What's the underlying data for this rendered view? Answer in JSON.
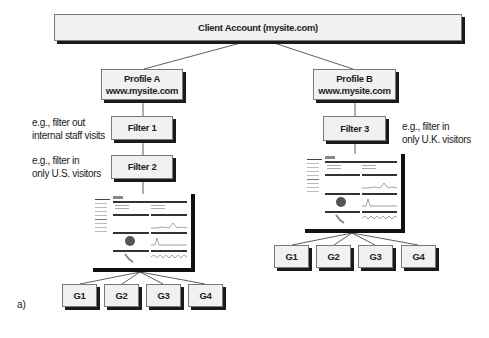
{
  "diagram": {
    "root": {
      "label": "Client Account (mysite.com)"
    },
    "profiles": [
      {
        "title": "Profile A",
        "site": "www.mysite.com",
        "filters": [
          {
            "label": "Filter 1",
            "note_line1": "e.g., filter out",
            "note_line2": "internal staff visits"
          },
          {
            "label": "Filter 2",
            "note_line1": "e.g., filter in",
            "note_line2": "only U.S. visitors"
          }
        ],
        "goals": [
          "G1",
          "G2",
          "G3",
          "G4"
        ]
      },
      {
        "title": "Profile B",
        "site": "www.mysite.com",
        "filters": [
          {
            "label": "Filter 3",
            "note_line1": "e.g., filter in",
            "note_line2": "only U.K. visitors"
          }
        ],
        "goals": [
          "G1",
          "G2",
          "G3",
          "G4"
        ]
      }
    ],
    "caption": "a)",
    "colors": {
      "box_fill": "#f1f1f1",
      "box_border": "#7a7a7a",
      "shadow": "#1a1a1a",
      "line": "#333333"
    }
  }
}
